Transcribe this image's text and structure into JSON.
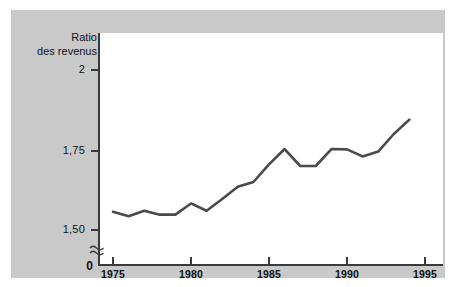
{
  "figure": {
    "background_color": "#c9c9c9",
    "plot_background_color": "#ffffff",
    "line_color": "#4a4a4a",
    "axis_color": "#3a3a3a"
  },
  "axis": {
    "y_label_line1": "Ratio",
    "y_label_line2": "des revenus",
    "zero_label": "0",
    "break_icon": "axis-break-squiggle"
  },
  "chart_data": {
    "type": "line",
    "title": "",
    "subtitle": "",
    "xlabel": "",
    "ylabel": "Ratio des revenus",
    "xlim": [
      1975,
      1995
    ],
    "ylim": [
      1.46,
      2.03
    ],
    "grid": false,
    "legend": null,
    "y_axis_break": true,
    "y_tick_labels": [
      "2",
      "1,75",
      "1,50"
    ],
    "y_tick_values": [
      2,
      1.75,
      1.5
    ],
    "x_tick_labels": [
      "1975",
      "1980",
      "1985",
      "1990",
      "1995"
    ],
    "x_tick_values": [
      1975,
      1980,
      1985,
      1990,
      1995
    ],
    "x": [
      1975,
      1976,
      1977,
      1978,
      1979,
      1980,
      1981,
      1982,
      1983,
      1984,
      1985,
      1986,
      1987,
      1988,
      1989,
      1990,
      1991,
      1992,
      1993,
      1994
    ],
    "values": [
      1.557,
      1.543,
      1.56,
      1.548,
      1.548,
      1.583,
      1.56,
      1.597,
      1.635,
      1.65,
      1.705,
      1.753,
      1.7,
      1.7,
      1.753,
      1.752,
      1.73,
      1.745,
      1.8,
      1.845
    ],
    "series": [
      {
        "name": "Ratio des revenus",
        "values": [
          1.557,
          1.543,
          1.56,
          1.548,
          1.548,
          1.583,
          1.56,
          1.597,
          1.635,
          1.65,
          1.705,
          1.753,
          1.7,
          1.7,
          1.753,
          1.752,
          1.73,
          1.745,
          1.8,
          1.845
        ]
      }
    ]
  }
}
